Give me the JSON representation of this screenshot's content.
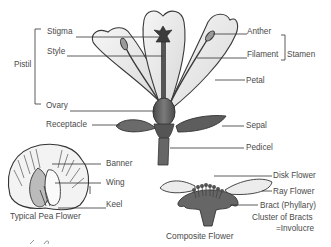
{
  "main_flower": {
    "labels_left": {
      "stigma": "Stigma",
      "style": "Style",
      "pistil": "Pistil",
      "ovary": "Ovary",
      "receptacle": "Receptacle"
    },
    "labels_right": {
      "anther": "Anther",
      "filament": "Filament",
      "stamen": "Stamen",
      "petal": "Petal",
      "sepal": "Sepal",
      "pedicel": "Pedicel"
    }
  },
  "pea_flower": {
    "caption": "Typical Pea Flower",
    "labels": {
      "banner": "Banner",
      "wing": "Wing",
      "keel": "Keel"
    }
  },
  "composite_flower": {
    "caption": "Composite Flower",
    "labels": {
      "disk_flower": "Disk Flower",
      "ray_flower": "Ray Flower",
      "bract": "Bract (Phyllary)",
      "cluster_line1": "Cluster of Bracts",
      "cluster_line2": "=Involucre"
    }
  },
  "colors": {
    "outline": "#3a3a3a",
    "petal_fill": "#ececec",
    "dark_fill": "#5a5a5a",
    "text": "#4a4a4a",
    "leader_line": "#333333"
  }
}
